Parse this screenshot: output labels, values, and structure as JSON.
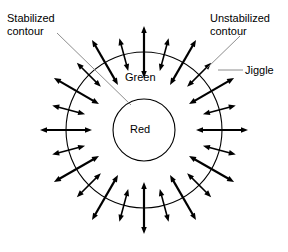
{
  "figure": {
    "background_color": "#ffffff",
    "stroke_color": "#000000",
    "leader_color": "#808080"
  },
  "labels": {
    "stabilized_contour": "Stabilized\ncontour",
    "unstabilized_contour": "Unstabilized\ncontour",
    "jiggle": "Jiggle",
    "green": "Green",
    "red": "Red"
  },
  "geometry": {
    "center_x": 144,
    "center_y": 130,
    "inner_radius": 31,
    "outer_radius": 78,
    "arrow_count": 24,
    "arrow_step_degrees": 15,
    "arrow_inner_offset_long": 26,
    "arrow_outer_offset_long": 26,
    "arrow_inner_offset_short": 17,
    "arrow_outer_offset_short": 17,
    "arrow_head_length": 7,
    "arrow_head_width": 5.5,
    "shaft_width_long": 2.2,
    "shaft_width_short": 1.6,
    "circle_stroke_width": 1.1
  },
  "leaders": {
    "stabilized": {
      "x1": 57,
      "y1": 33,
      "x2": 131,
      "y2": 105
    },
    "unstabilized": {
      "x1": 240,
      "y1": 36,
      "x2": 206,
      "y2": 69
    },
    "jiggle": {
      "x1": 243,
      "y1": 70,
      "x2": 218,
      "y2": 70
    }
  }
}
